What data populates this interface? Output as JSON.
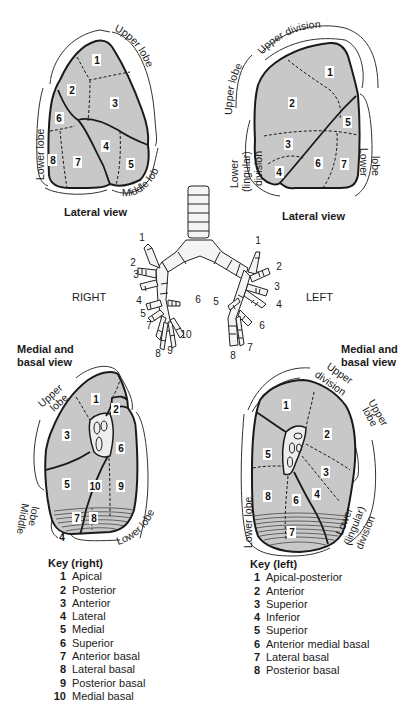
{
  "right_lateral": {
    "caption": "Lateral view",
    "labels": {
      "upper": "Upper lobe",
      "lower": "Lower lobe",
      "middle": "Middle lobe"
    },
    "segments": [
      "1",
      "2",
      "3",
      "4",
      "5",
      "6",
      "7",
      "8"
    ]
  },
  "left_lateral": {
    "caption": "Lateral view",
    "labels": {
      "upper_lobe": "Upper lobe",
      "upper_division": "Upper division",
      "lower_lingular": [
        "Lower",
        "(lingular)",
        "division"
      ],
      "lower_lobe": [
        "Lower",
        "lobe"
      ]
    },
    "segments": [
      "1",
      "2",
      "3",
      "4",
      "5",
      "6",
      "7"
    ]
  },
  "bronchi": {
    "right_label": "RIGHT",
    "left_label": "LEFT",
    "right_numbers": [
      "1",
      "2",
      "3",
      "4",
      "5",
      "6",
      "7",
      "8",
      "9",
      "10"
    ],
    "left_numbers": [
      "1",
      "2",
      "3",
      "4",
      "5",
      "6",
      "7",
      "8"
    ]
  },
  "right_medial": {
    "caption": [
      "Medial and",
      "basal view"
    ],
    "labels": {
      "upper": [
        "Upper",
        "lobe"
      ],
      "middle": [
        "Middle",
        "lobe"
      ],
      "lower": "Lower lobe"
    },
    "segments": [
      "1",
      "2",
      "3",
      "4",
      "5",
      "6",
      "7",
      "8",
      "9",
      "10"
    ]
  },
  "left_medial": {
    "caption": [
      "Medial and",
      "basal view"
    ],
    "labels": {
      "upper_division": [
        "Upper",
        "division"
      ],
      "upper_lobe": [
        "Upper",
        "lobe"
      ],
      "lower_lobe": "Lower lobe",
      "lower_lingular": [
        "Lower",
        "(lingular)",
        "division"
      ]
    },
    "segments": [
      "1",
      "2",
      "3",
      "4",
      "5",
      "6",
      "7",
      "8"
    ]
  },
  "key_right": {
    "title": "Key (right)",
    "items": [
      {
        "n": "1",
        "label": "Apical"
      },
      {
        "n": "2",
        "label": "Posterior"
      },
      {
        "n": "3",
        "label": "Anterior"
      },
      {
        "n": "4",
        "label": "Lateral"
      },
      {
        "n": "5",
        "label": "Medial"
      },
      {
        "n": "6",
        "label": "Superior"
      },
      {
        "n": "7",
        "label": "Anterior basal"
      },
      {
        "n": "8",
        "label": "Lateral basal"
      },
      {
        "n": "9",
        "label": "Posterior basal"
      },
      {
        "n": "10",
        "label": "Medial basal"
      }
    ]
  },
  "key_left": {
    "title": "Key (left)",
    "items": [
      {
        "n": "1",
        "label": "Apical-posterior"
      },
      {
        "n": "2",
        "label": "Anterior"
      },
      {
        "n": "3",
        "label": "Superior"
      },
      {
        "n": "4",
        "label": "Inferior"
      },
      {
        "n": "5",
        "label": "Superior"
      },
      {
        "n": "6",
        "label": "Anterior medial basal"
      },
      {
        "n": "7",
        "label": "Lateral basal"
      },
      {
        "n": "8",
        "label": "Posterior basal"
      }
    ]
  }
}
